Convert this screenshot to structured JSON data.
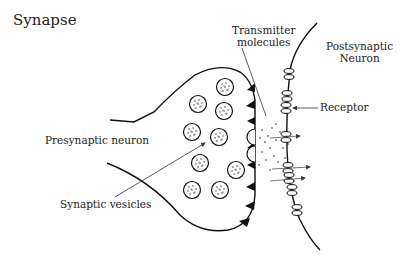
{
  "diagram": {
    "title": "Synapse",
    "labels": {
      "transmitter_line1": "Transmitter",
      "transmitter_line2": "molecules",
      "postsynaptic_line1": "Postsynaptic",
      "postsynaptic_line2": "Neuron",
      "receptor": "Receptor",
      "presynaptic": "Presynaptic neuron",
      "vesicles": "Synaptic vesicles"
    },
    "colors": {
      "ink": "#111111",
      "text": "#222222",
      "background": "#ffffff"
    }
  }
}
